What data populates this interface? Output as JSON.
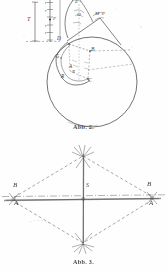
{
  "document": {
    "kind": "scanned-figure-page",
    "language": "de",
    "background_color": "#fefefe",
    "ink_color": "#434343"
  },
  "figures": [
    {
      "id": "abb-2",
      "caption": "Abb. 2.",
      "description": "Kreis mit eingeschriebenem Vieleck und vertikaler Maßskala",
      "scale": {
        "bracket_label": "T",
        "tick_labels": [
          "r",
          "r",
          "r",
          "r",
          "r"
        ],
        "point_labels": [
          "F",
          "D"
        ]
      },
      "labels": [
        {
          "text": "T",
          "x": 29,
          "y": 19
        },
        {
          "text": "r",
          "x": 45,
          "y": 4
        },
        {
          "text": "r",
          "x": 45,
          "y": 12
        },
        {
          "text": "F",
          "x": 47,
          "y": 19
        },
        {
          "text": "r",
          "x": 45,
          "y": 27
        },
        {
          "text": "r",
          "x": 45,
          "y": 34
        },
        {
          "text": "D",
          "x": 59,
          "y": 39
        },
        {
          "text": "M",
          "x": 97,
          "y": 14
        },
        {
          "text": "P",
          "x": 104,
          "y": 14
        },
        {
          "text": "O",
          "x": 79,
          "y": 14
        },
        {
          "text": "E",
          "x": 76,
          "y": 4
        },
        {
          "text": "G",
          "x": 56,
          "y": 58
        },
        {
          "text": "B",
          "x": 92,
          "y": 51
        },
        {
          "text": "A",
          "x": 71,
          "y": 68
        },
        {
          "text": "C",
          "x": 89,
          "y": 81
        },
        {
          "text": "R",
          "x": 62,
          "y": 77
        },
        {
          "text": "R",
          "x": 73,
          "y": 73
        }
      ]
    },
    {
      "id": "abb-3",
      "caption": "Abb. 3.",
      "description": "Rautenförmiges Strichdiagramm mit Mittelpunkt S und Punkten A, B",
      "labels": [
        {
          "text": "B",
          "x": 15,
          "y": 187
        },
        {
          "text": "A",
          "x": 16,
          "y": 203
        },
        {
          "text": "S",
          "x": 88,
          "y": 186
        },
        {
          "text": "B",
          "x": 148,
          "y": 186
        },
        {
          "text": "A",
          "x": 150,
          "y": 203
        }
      ],
      "geometry": {
        "center": {
          "x": 83,
          "y": 198
        },
        "left_vertex": {
          "x": 12,
          "y": 199
        },
        "right_vertex": {
          "x": 153,
          "y": 198
        },
        "top_vertex": {
          "x": 83,
          "y": 154
        },
        "bottom_vertex": {
          "x": 83,
          "y": 245
        }
      }
    }
  ]
}
